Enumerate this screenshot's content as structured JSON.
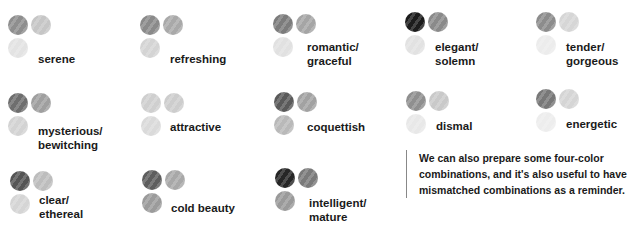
{
  "combinations": [
    {
      "label": "serene",
      "colors": [
        "#8e8e8e",
        "#c6c6c6",
        "#e3e3e3"
      ],
      "pos": [
        8,
        15
      ],
      "label_pos": [
        38,
        52
      ]
    },
    {
      "label": "refreshing",
      "colors": [
        "#8a8a8a",
        "#a9a9a9",
        "#d4d4d4"
      ],
      "pos": [
        140,
        15
      ],
      "label_pos": [
        170,
        52
      ]
    },
    {
      "label": "romantic/\ngraceful",
      "colors": [
        "#7c7c7c",
        "#a5a5a5",
        "#e1e1e1"
      ],
      "pos": [
        273,
        14
      ],
      "label_pos": [
        307,
        40
      ]
    },
    {
      "label": "elegant/\nsolemn",
      "colors": [
        "#1c1c1c",
        "#8a8a8a",
        "#e2e2e2"
      ],
      "pos": [
        405,
        12
      ],
      "label_pos": [
        435,
        40
      ]
    },
    {
      "label": "tender/\ngorgeous",
      "colors": [
        "#8c8c8c",
        "#d6d6d6",
        "#ececec"
      ],
      "pos": [
        536,
        12
      ],
      "label_pos": [
        566,
        40
      ]
    },
    {
      "label": "mysterious/\nbewitching",
      "colors": [
        "#6e6e6e",
        "#9f9f9f",
        "#d3d3d3"
      ],
      "pos": [
        8,
        93
      ],
      "label_pos": [
        38,
        124
      ]
    },
    {
      "label": "attractive",
      "colors": [
        "#cfcfcf",
        "#cdcdcd",
        "#dadada"
      ],
      "pos": [
        141,
        93
      ],
      "label_pos": [
        170,
        120
      ]
    },
    {
      "label": "coquettish",
      "colors": [
        "#5a5a5a",
        "#a2a2a2",
        "#b9b9b9"
      ],
      "pos": [
        274,
        92
      ],
      "label_pos": [
        307,
        120
      ]
    },
    {
      "label": "dismal",
      "colors": [
        "#8f8f8f",
        "#c9c9c9",
        "#e8e8e8"
      ],
      "pos": [
        406,
        91
      ],
      "label_pos": [
        436,
        119
      ]
    },
    {
      "label": "energetic",
      "colors": [
        "#787878",
        "#d5d5d5",
        "#ededed"
      ],
      "pos": [
        536,
        89
      ],
      "label_pos": [
        566,
        117
      ]
    },
    {
      "label": "clear/\nethereal",
      "colors": [
        "#555555",
        "#bdbdbd",
        "#d5d5d5"
      ],
      "pos": [
        10,
        171
      ],
      "label_pos": [
        39,
        193
      ]
    },
    {
      "label": "cold beauty",
      "colors": [
        "#5e5e5e",
        "#a8a8a8",
        "#9b9b9b"
      ],
      "pos": [
        142,
        170
      ],
      "label_pos": [
        171,
        201
      ]
    },
    {
      "label": "intelligent/\nmature",
      "colors": [
        "#262626",
        "#7a7a7a",
        "#9a9a9a"
      ],
      "pos": [
        275,
        168
      ],
      "label_pos": [
        309,
        196
      ]
    }
  ],
  "note": {
    "text": "We can also prepare some four-color combinations, and it's also useful to have mismatched combinations as a reminder."
  }
}
